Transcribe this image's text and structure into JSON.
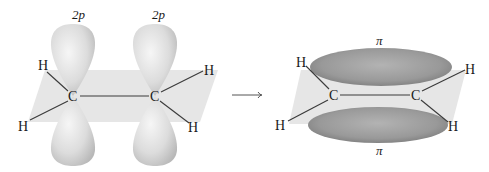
{
  "figure": {
    "left_panel": {
      "description": "Two sp2 carbons with unhybridized 2p orbitals perpendicular to the molecular plane",
      "orbital_labels": [
        "2p",
        "2p"
      ],
      "atoms": {
        "c_left": "C",
        "c_right": "C",
        "h_top_left": "H",
        "h_bottom_left": "H",
        "h_top_right": "H",
        "h_bottom_right": "H"
      }
    },
    "arrow": {
      "symbol": "→"
    },
    "right_panel": {
      "description": "Overlap of 2p orbitals forming a pi bond above and below the plane",
      "orbital_labels": {
        "top": "π",
        "bottom": "π"
      },
      "atoms": {
        "c_left": "C",
        "c_right": "C",
        "h_top_left": "H",
        "h_bottom_left": "H",
        "h_top_right": "H",
        "h_bottom_right": "H"
      }
    },
    "colors": {
      "plane": "#e4e4e4",
      "p_orbital_light": "#f2f2f2",
      "p_orbital_dark": "#bdbdbd",
      "pi_orbital_light": "#b5b5b5",
      "pi_orbital_dark": "#858585",
      "bond": "#3a3a3a",
      "text": "#1a1a1a"
    }
  }
}
